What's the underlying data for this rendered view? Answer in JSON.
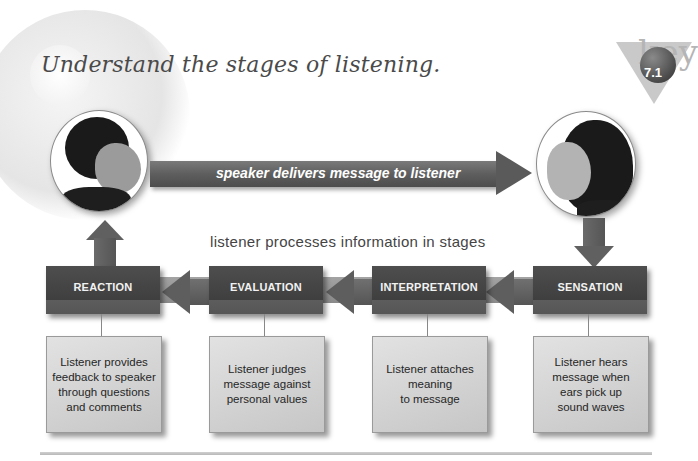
{
  "title": "Understand the stages of listening.",
  "key_badge": {
    "word": "key",
    "number": "7.1"
  },
  "speaker": {
    "role": "speaker",
    "portrait": "woman-laughing-profile"
  },
  "listener": {
    "role": "listener",
    "portrait": "woman-profile-long-hair"
  },
  "main_arrow": {
    "label": "speaker delivers message to listener"
  },
  "process_label": "listener processes information in stages",
  "stages": [
    {
      "name": "REACTION",
      "description": "Listener provides\nfeedback to speaker\nthrough questions\nand comments"
    },
    {
      "name": "EVALUATION",
      "description": "Listener judges\nmessage against\npersonal values"
    },
    {
      "name": "INTERPRETATION",
      "description": "Listener attaches\nmeaning\nto message"
    },
    {
      "name": "SENSATION",
      "description": "Listener hears\nmessage when\nears pick up\nsound waves"
    }
  ],
  "colors": {
    "stage_box": "#4a4a4a",
    "description_box": "#d4d4d4",
    "arrow": "#5e5e5e",
    "title_text": "#4a4a4a"
  }
}
